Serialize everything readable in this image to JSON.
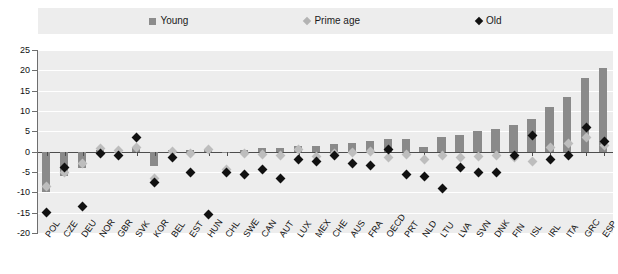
{
  "legend": {
    "items": [
      {
        "label": "Young",
        "marker": "square-marker",
        "color": "#8c8c8c"
      },
      {
        "label": "Prime age",
        "marker": "diamond-marker",
        "color": "#b3b3b3"
      },
      {
        "label": "Old",
        "marker": "diamond-marker",
        "color": "#111111"
      }
    ]
  },
  "chart_data": {
    "type": "bar",
    "title": "",
    "xlabel": "",
    "ylabel": "",
    "ylim": [
      -20,
      25
    ],
    "yticks": [
      25,
      20,
      15,
      10,
      5,
      0,
      -5,
      -10,
      -15,
      -20
    ],
    "grid": true,
    "legend_position": "top",
    "categories": [
      "POL",
      "CZE",
      "DEU",
      "NOR",
      "GBR",
      "SVK",
      "KOR",
      "BEL",
      "EST",
      "HUN",
      "CHL",
      "SWE",
      "CAN",
      "AUT",
      "LUX",
      "MEX",
      "CHE",
      "AUS",
      "FRA",
      "OECD",
      "PRT",
      "NLD",
      "LTU",
      "LVA",
      "SVN",
      "DNK",
      "FIN",
      "ISL",
      "IRL",
      "ITA",
      "GRC",
      "ESP"
    ],
    "series": [
      {
        "name": "Young",
        "type": "bar",
        "color": "#8a8a8a",
        "values": [
          -10.0,
          -6.0,
          -4.0,
          0.5,
          -0.3,
          0.8,
          -3.5,
          0.3,
          0.4,
          0.6,
          -0.2,
          0.5,
          0.8,
          1.0,
          1.3,
          1.5,
          2.0,
          2.2,
          2.6,
          3.0,
          3.2,
          1.2,
          3.6,
          4.0,
          5.0,
          5.5,
          6.5,
          8.0,
          11.0,
          13.5,
          18.0,
          20.5
        ]
      },
      {
        "name": "Prime age",
        "type": "scatter",
        "color": "#bdbdbd",
        "values": [
          -8.5,
          -5.0,
          -3.0,
          0.7,
          0.2,
          1.0,
          -6.5,
          0.0,
          -0.5,
          0.5,
          -4.5,
          -0.5,
          -0.8,
          -1.0,
          0.6,
          -1.2,
          -0.5,
          -0.2,
          0.0,
          -1.5,
          -0.8,
          -2.0,
          -1.0,
          -1.5,
          -1.2,
          -1.0,
          -1.5,
          -2.5,
          1.0,
          2.0,
          3.5,
          1.5
        ]
      },
      {
        "name": "Old",
        "type": "scatter",
        "color": "#111111",
        "values": [
          -15.0,
          -4.0,
          -13.5,
          -0.5,
          -1.0,
          3.5,
          -7.5,
          -1.5,
          -5.0,
          -15.5,
          -5.0,
          -5.5,
          -4.5,
          -6.5,
          -2.0,
          -2.5,
          -1.0,
          -3.0,
          -3.5,
          0.5,
          -5.5,
          -6.0,
          -9.0,
          -4.0,
          -5.0,
          -5.0,
          -1.0,
          4.0,
          -2.0,
          -1.0,
          6.0,
          2.5
        ]
      }
    ]
  }
}
